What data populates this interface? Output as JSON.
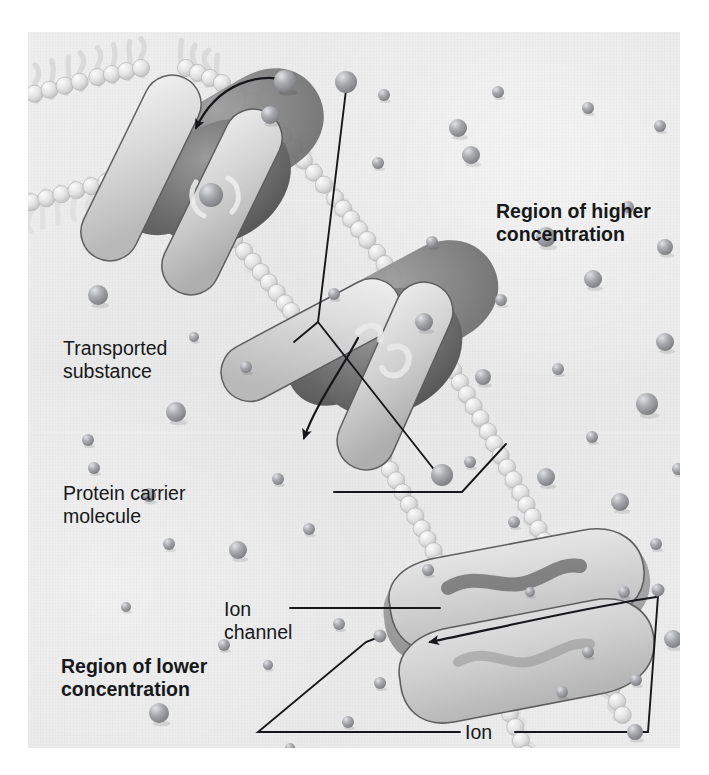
{
  "figure": {
    "kind": "biology-diagram",
    "background_color": "#ececec",
    "text_color": "#16181a"
  },
  "labels": {
    "region_higher": "Region of higher\nconcentration",
    "region_lower": "Region of lower\nconcentration",
    "transported_substance": "Transported\nsubstance",
    "protein_carrier": "Protein carrier\nmolecule",
    "ion_channel": "Ion\nchannel",
    "ion": "Ion",
    "cell_membrane": "Cell membrane"
  },
  "label_positions": {
    "region_higher": {
      "x": 468,
      "y": 168
    },
    "region_lower": {
      "x": 33,
      "y": 623
    },
    "transported_substance": {
      "x": 35,
      "y": 305
    },
    "protein_carrier": {
      "x": 35,
      "y": 450
    },
    "ion_channel": {
      "x": 226,
      "y": 568
    },
    "ion": {
      "x": 463,
      "y": 694
    },
    "cell_membrane": {
      "x": 246,
      "y": 718
    }
  },
  "structures": {
    "membrane": {
      "name": "phospholipid bilayer",
      "head_color": "#e3e3e3",
      "tail_color": "#dcdcdc",
      "orientation": "diagonal from upper-left to lower-right"
    },
    "carrier_proteins": [
      {
        "id": "carrier-upper",
        "state": "substance bound inside",
        "x": 175,
        "y": 150
      },
      {
        "id": "carrier-middle",
        "state": "substance released",
        "x": 330,
        "y": 300
      }
    ],
    "ion_channel_protein": {
      "id": "ion-channel",
      "state": "ion passing through",
      "x": 520,
      "y": 610
    },
    "particle_color": "#8d8f93",
    "particle_highlight": "#d8dade"
  },
  "chart_data": {
    "type": "diagram",
    "annotations": [
      "Region of higher concentration",
      "Region of lower concentration",
      "Transported substance",
      "Protein carrier molecule",
      "Ion channel",
      "Ion",
      "Cell membrane"
    ]
  },
  "particles_high": [
    [
      257,
      49,
      11
    ],
    [
      430,
      96,
      9
    ],
    [
      632,
      94,
      6
    ],
    [
      350,
      131,
      6
    ],
    [
      560,
      76,
      6
    ],
    [
      600,
      175,
      6
    ],
    [
      443,
      123,
      9
    ],
    [
      518,
      205,
      10
    ],
    [
      242,
      83,
      9
    ],
    [
      637,
      215,
      8
    ],
    [
      404,
      210,
      6
    ],
    [
      473,
      268,
      6
    ],
    [
      565,
      247,
      9
    ],
    [
      396,
      290,
      9
    ],
    [
      306,
      262,
      6
    ],
    [
      637,
      310,
      9
    ],
    [
      530,
      337,
      6
    ],
    [
      455,
      345,
      8
    ],
    [
      619,
      372,
      11
    ],
    [
      564,
      405,
      6
    ],
    [
      518,
      445,
      9
    ],
    [
      650,
      437,
      6
    ],
    [
      592,
      470,
      9
    ],
    [
      628,
      512,
      6
    ],
    [
      672,
      270,
      8
    ],
    [
      676,
      350,
      6
    ],
    [
      669,
      540,
      9
    ],
    [
      596,
      560,
      6
    ],
    [
      645,
      607,
      9
    ],
    [
      608,
      648,
      6
    ],
    [
      671,
      662,
      9
    ],
    [
      486,
      490,
      6
    ],
    [
      502,
      560,
      5
    ],
    [
      560,
      620,
      6
    ],
    [
      607,
      700,
      8
    ],
    [
      665,
      726,
      7
    ],
    [
      534,
      660,
      6
    ],
    [
      442,
      430,
      6
    ],
    [
      356,
      63,
      6
    ],
    [
      470,
      60,
      6
    ],
    [
      678,
      120,
      6
    ]
  ],
  "particles_low": [
    [
      70,
      263,
      10
    ],
    [
      148,
      380,
      10
    ],
    [
      60,
      408,
      6
    ],
    [
      121,
      463,
      7
    ],
    [
      141,
      512,
      6
    ],
    [
      210,
      518,
      9
    ],
    [
      66,
      436,
      6
    ],
    [
      196,
      613,
      6
    ],
    [
      131,
      681,
      10
    ],
    [
      281,
      497,
      6
    ],
    [
      311,
      592,
      6
    ],
    [
      250,
      447,
      6
    ],
    [
      240,
      633,
      5
    ],
    [
      352,
      651,
      6
    ],
    [
      320,
      690,
      6
    ],
    [
      400,
      538,
      6
    ],
    [
      178,
      724,
      6
    ],
    [
      262,
      716,
      5
    ],
    [
      98,
      575,
      5
    ],
    [
      218,
      335,
      6
    ],
    [
      166,
      305,
      5
    ]
  ]
}
